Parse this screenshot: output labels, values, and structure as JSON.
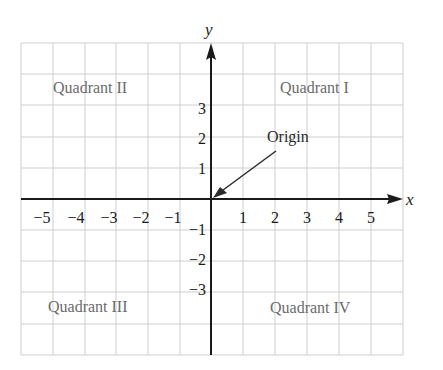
{
  "diagram": {
    "type": "coordinate-plane",
    "axes": {
      "x_label": "x",
      "y_label": "y"
    },
    "x_ticks": [
      "−5",
      "−4",
      "−3",
      "−2",
      "−1",
      "1",
      "2",
      "3",
      "4",
      "5"
    ],
    "y_ticks_positive": [
      "1",
      "2",
      "3"
    ],
    "y_ticks_negative": [
      "−1",
      "−2",
      "−3"
    ],
    "quadrants": {
      "q1": "Quadrant I",
      "q2": "Quadrant II",
      "q3": "Quadrant III",
      "q4": "Quadrant IV"
    },
    "origin_label": "Origin",
    "colors": {
      "grid": "#c8c8c8",
      "axis": "#1a1a1a",
      "quadrant_text": "#6b6b6b"
    }
  }
}
